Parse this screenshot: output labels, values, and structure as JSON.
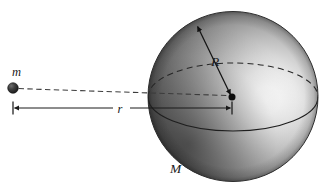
{
  "figure": {
    "background_color": "#ffffff",
    "width": 328,
    "height": 190
  },
  "labels": {
    "point_mass": "m",
    "sphere_mass": "M",
    "sphere_radius": "R",
    "separation": "r"
  },
  "colors": {
    "ink": "#1a1a1a",
    "sphere_highlight": "#ffffff",
    "sphere_midtone": "#9a9a9a",
    "sphere_shadow": "#4a4a4a",
    "sphere_edge": "#2e2e2e",
    "point_mass_fill": "#2b2b2b",
    "guide_line": "#3a3a3a"
  },
  "geometry": {
    "sphere": {
      "cx": 233,
      "cy": 96.5,
      "r": 85
    },
    "sphere_highlight": {
      "cx": 268,
      "cy": 100,
      "r": 72
    },
    "equator": {
      "cx": 233,
      "cy": 97,
      "rx": 85,
      "ry": 34
    },
    "center_dot": {
      "cx": 232,
      "cy": 97,
      "r": 3.4
    },
    "point_mass": {
      "cx": 13,
      "cy": 88,
      "r": 5.2
    },
    "dashed_line": {
      "x1": 18,
      "y1": 88.5,
      "x2": 230,
      "y2": 96
    },
    "dimension_line": {
      "x1": 13,
      "y1": 108,
      "x2": 232,
      "y2": 108
    },
    "radius_arrow": {
      "x1": 232,
      "y1": 96,
      "x2": 196,
      "y2": 22
    }
  },
  "label_positions": {
    "point_mass": {
      "x": 12,
      "y": 76,
      "size": 12
    },
    "sphere_mass": {
      "x": 171,
      "y": 173,
      "size": 13
    },
    "sphere_radius": {
      "x": 212,
      "y": 66,
      "size": 13
    },
    "separation": {
      "x": 118,
      "y": 112,
      "size": 12
    }
  }
}
